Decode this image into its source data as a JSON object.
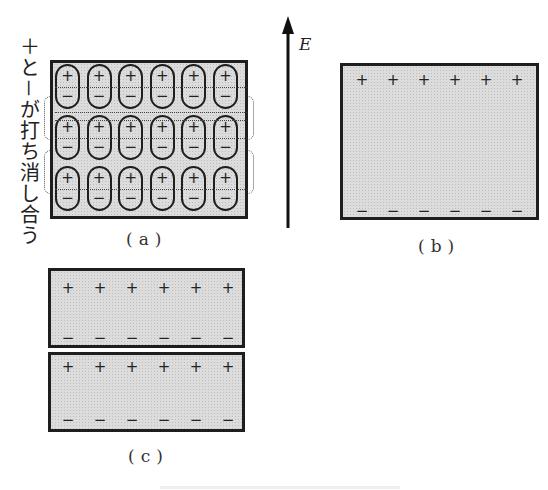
{
  "figure": {
    "side_label": "＋と－が打ち消し合う",
    "field_label": "E",
    "panels": {
      "a": {
        "caption": "(a)",
        "rows": 3,
        "cols": 6,
        "dipole_top_sign": "+",
        "dipole_bottom_sign": "−"
      },
      "b": {
        "caption": "(b)",
        "top_signs": [
          "+",
          "+",
          "+",
          "+",
          "+",
          "+"
        ],
        "bottom_signs": [
          "−",
          "−",
          "−",
          "−",
          "−",
          "−"
        ]
      },
      "c": {
        "caption": "(c)",
        "slabs": [
          {
            "top_signs": [
              "+",
              "+",
              "+",
              "+",
              "+",
              "+"
            ],
            "bottom_signs": [
              "−",
              "−",
              "−",
              "−",
              "−",
              "−"
            ]
          },
          {
            "top_signs": [
              "+",
              "+",
              "+",
              "+",
              "+",
              "+"
            ],
            "bottom_signs": [
              "−",
              "−",
              "−",
              "−",
              "−",
              "−"
            ]
          }
        ]
      }
    },
    "colors": {
      "fill": "#dcdcdc",
      "stroke": "#1e1e1e"
    }
  }
}
